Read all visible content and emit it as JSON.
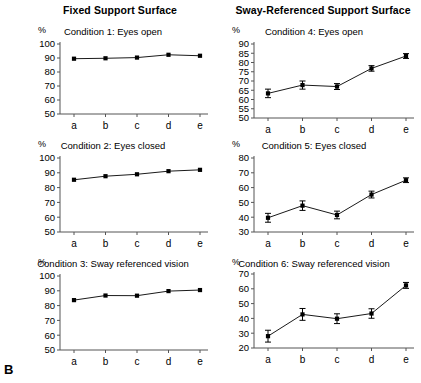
{
  "figure": {
    "label": "B",
    "unit_label": "%",
    "headings": {
      "left": "Fixed Support Surface",
      "right": "Sway-Referenced Support Surface"
    }
  },
  "chart_data": [
    {
      "type": "line",
      "panel": 1,
      "title": "Condition 1: Eyes open",
      "column": "Fixed Support Surface",
      "categories": [
        "a",
        "b",
        "c",
        "d",
        "e"
      ],
      "x": [
        "a",
        "b",
        "c",
        "d",
        "e"
      ],
      "values": [
        89.5,
        89.8,
        90.3,
        92.3,
        91.6
      ],
      "errors": [
        0,
        0,
        0,
        0,
        0
      ],
      "xlabel": "",
      "ylabel": "%",
      "ylim": [
        50,
        100
      ],
      "yticks": [
        50,
        60,
        70,
        80,
        90,
        100
      ],
      "grid": false,
      "legend": false
    },
    {
      "type": "line",
      "panel": 2,
      "title": "Condition 2: Eyes closed",
      "column": "Fixed Support Surface",
      "categories": [
        "a",
        "b",
        "c",
        "d",
        "e"
      ],
      "x": [
        "a",
        "b",
        "c",
        "d",
        "e"
      ],
      "values": [
        85.3,
        87.7,
        89.0,
        91.1,
        92.0
      ],
      "errors": [
        0,
        0,
        0,
        0,
        0
      ],
      "xlabel": "",
      "ylabel": "%",
      "ylim": [
        50,
        100
      ],
      "yticks": [
        50,
        60,
        70,
        80,
        90,
        100
      ],
      "grid": false,
      "legend": false
    },
    {
      "type": "line",
      "panel": 3,
      "title": "Condition 3: Sway referenced vision",
      "column": "Fixed Support Surface",
      "categories": [
        "a",
        "b",
        "c",
        "d",
        "e"
      ],
      "x": [
        "a",
        "b",
        "c",
        "d",
        "e"
      ],
      "values": [
        83.7,
        86.8,
        86.7,
        89.8,
        90.5
      ],
      "errors": [
        0,
        0,
        0,
        0,
        0
      ],
      "xlabel": "",
      "ylabel": "%",
      "ylim": [
        50,
        100
      ],
      "yticks": [
        50,
        60,
        70,
        80,
        90,
        100
      ],
      "grid": false,
      "legend": false
    },
    {
      "type": "line",
      "panel": 4,
      "title": "Condition 4: Eyes open",
      "column": "Sway-Referenced Support Surface",
      "categories": [
        "a",
        "b",
        "c",
        "d",
        "e"
      ],
      "x": [
        "a",
        "b",
        "c",
        "d",
        "e"
      ],
      "values": [
        63.3,
        67.8,
        67.0,
        76.8,
        83.5
      ],
      "errors": [
        2.3,
        2.2,
        1.6,
        1.5,
        1.3
      ],
      "xlabel": "",
      "ylabel": "%",
      "ylim": [
        50,
        90
      ],
      "yticks": [
        50,
        55,
        60,
        65,
        70,
        75,
        80,
        85,
        90
      ],
      "grid": false,
      "legend": false
    },
    {
      "type": "line",
      "panel": 5,
      "title": "Condition 5: Eyes closed",
      "column": "Sway-Referenced Support Surface",
      "categories": [
        "a",
        "b",
        "c",
        "d",
        "e"
      ],
      "x": [
        "a",
        "b",
        "c",
        "d",
        "e"
      ],
      "values": [
        39.6,
        47.8,
        41.5,
        55.3,
        65.0
      ],
      "errors": [
        3.0,
        3.2,
        2.6,
        2.3,
        1.6
      ],
      "xlabel": "",
      "ylabel": "%",
      "ylim": [
        30,
        80
      ],
      "yticks": [
        30,
        40,
        50,
        60,
        70,
        80
      ],
      "grid": false,
      "legend": false
    },
    {
      "type": "line",
      "panel": 6,
      "title": "Condition 6: Sway referenced vision",
      "column": "Sway-Referenced Support Surface",
      "categories": [
        "a",
        "b",
        "c",
        "d",
        "e"
      ],
      "x": [
        "a",
        "b",
        "c",
        "d",
        "e"
      ],
      "values": [
        28.0,
        42.7,
        39.8,
        43.3,
        62.3
      ],
      "errors": [
        4.0,
        4.0,
        3.3,
        3.2,
        2.0
      ],
      "xlabel": "",
      "ylabel": "%",
      "ylim": [
        20,
        70
      ],
      "yticks": [
        20,
        30,
        40,
        50,
        60,
        70
      ],
      "grid": false,
      "legend": false
    }
  ],
  "style": {
    "line_color": "#1a1a1a",
    "marker_color": "#000000",
    "axis_color": "#555555",
    "background": "#ffffff"
  }
}
